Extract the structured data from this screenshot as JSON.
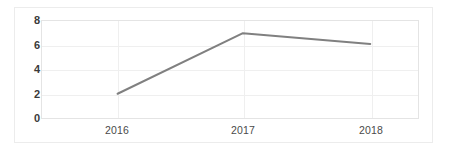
{
  "chart_data": {
    "type": "line",
    "title": "",
    "subtitle": "",
    "xlabel": "",
    "ylabel": "",
    "categories": [
      "2016",
      "2017",
      "2018"
    ],
    "series": [
      {
        "name": "Series 1",
        "values": [
          2.0,
          7.0,
          6.1
        ],
        "color": "#808080",
        "line_width": 2,
        "markers": false
      }
    ],
    "ylim": [
      0,
      8
    ],
    "yticks": [
      0,
      2,
      4,
      6,
      8
    ],
    "ytick_labels": [
      "0",
      "2",
      "4",
      "6",
      "8"
    ],
    "xtick_labels": [
      "2016",
      "2017",
      "2018"
    ],
    "grid": {
      "horizontal": true,
      "vertical": true,
      "color": "#efefef"
    },
    "legend": {
      "visible": false,
      "position": "none"
    },
    "plot_border_color": "#e4e4e4",
    "frame_border_color": "#ececec",
    "background_color": "#ffffff"
  },
  "axes": {
    "y_tick_0": "0",
    "y_tick_1": "2",
    "y_tick_2": "4",
    "y_tick_3": "6",
    "y_tick_4": "8",
    "x_tick_0": "2016",
    "x_tick_1": "2017",
    "x_tick_2": "2018"
  }
}
